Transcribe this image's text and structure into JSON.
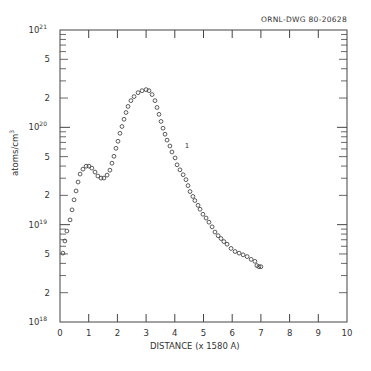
{
  "drawing_id": "ORNL-DWG 80-20628",
  "chart_data": {
    "type": "scatter",
    "title": "",
    "xlabel": "DISTANCE (x 1580 A)",
    "ylabel": "atoms/cm3",
    "ylabel_unit": {
      "base": "atoms/cm",
      "exp": "3"
    },
    "xscale": "linear",
    "yscale": "log",
    "xlim": [
      0,
      10
    ],
    "ylim": [
      1e+18,
      1e+21
    ],
    "grid": false,
    "legend": null,
    "annotations": [
      {
        "text": "1",
        "x": 4.35,
        "y": 6.2e+19
      }
    ],
    "x_ticks": [
      "0",
      "1",
      "2",
      "3",
      "4",
      "5",
      "6",
      "7",
      "8",
      "9",
      "10"
    ],
    "y_tick_labels": [
      {
        "value": 1e+18,
        "label": "10",
        "exp": "18"
      },
      {
        "value": 2e+18,
        "label": "2"
      },
      {
        "value": 5e+18,
        "label": "5"
      },
      {
        "value": 1e+19,
        "label": "10",
        "exp": "19"
      },
      {
        "value": 2e+19,
        "label": "2"
      },
      {
        "value": 5e+19,
        "label": "5"
      },
      {
        "value": 1e+20,
        "label": "10",
        "exp": "20"
      },
      {
        "value": 2e+20,
        "label": "2"
      },
      {
        "value": 5e+20,
        "label": "5"
      },
      {
        "value": 1e+21,
        "label": "10",
        "exp": "21"
      }
    ],
    "series": [
      {
        "name": "profile 1",
        "marker": "open-circle",
        "x": [
          0.1,
          0.17,
          0.24,
          0.35,
          0.42,
          0.49,
          0.56,
          0.63,
          0.7,
          0.8,
          0.91,
          1.01,
          1.11,
          1.22,
          1.32,
          1.43,
          1.53,
          1.64,
          1.74,
          1.81,
          1.88,
          1.95,
          2.02,
          2.09,
          2.16,
          2.23,
          2.3,
          2.37,
          2.47,
          2.58,
          2.72,
          2.86,
          3.0,
          3.1,
          3.21,
          3.31,
          3.38,
          3.45,
          3.52,
          3.59,
          3.66,
          3.73,
          3.83,
          3.9,
          4.01,
          4.08,
          4.18,
          4.29,
          4.39,
          4.46,
          4.53,
          4.63,
          4.7,
          4.81,
          4.88,
          4.98,
          5.09,
          5.19,
          5.3,
          5.4,
          5.51,
          5.61,
          5.71,
          5.82,
          5.96,
          6.1,
          6.24,
          6.38,
          6.52,
          6.66,
          6.79,
          6.86,
          6.93,
          7.0
        ],
        "y": [
          5.1e+18,
          6.8e+18,
          8.6e+18,
          1.12e+19,
          1.42e+19,
          1.8e+19,
          2.22e+19,
          2.74e+19,
          3.31e+19,
          3.72e+19,
          3.99e+19,
          3.99e+19,
          3.81e+19,
          3.47e+19,
          3.16e+19,
          3.01e+19,
          3.01e+19,
          3.23e+19,
          3.63e+19,
          4.28e+19,
          5.04e+19,
          6.09e+19,
          7.19e+19,
          8.68e+19,
          1.02e+20,
          1.21e+20,
          1.42e+20,
          1.64e+20,
          1.88e+20,
          2.07e+20,
          2.27e+20,
          2.38e+20,
          2.44e+20,
          2.38e+20,
          2.17e+20,
          1.88e+20,
          1.6e+20,
          1.36e+20,
          1.15e+20,
          9.8e+19,
          8.5e+19,
          7.39e+19,
          6.43e+19,
          5.58e+19,
          4.85e+19,
          4.12e+19,
          3.66e+19,
          3.26e+19,
          2.9e+19,
          2.52e+19,
          2.19e+19,
          1.95e+19,
          1.77e+19,
          1.58e+19,
          1.44e+19,
          1.28e+19,
          1.17e+19,
          1.06e+19,
          9.5e+18,
          8.4e+18,
          7.7e+18,
          7.2e+18,
          6.7e+18,
          6.3e+18,
          5.7e+18,
          5.3e+18,
          5.1e+18,
          4.9e+18,
          4.7e+18,
          4.4e+18,
          4.2e+18,
          3.8e+18,
          3.7e+18,
          3.7e+18
        ]
      }
    ]
  }
}
